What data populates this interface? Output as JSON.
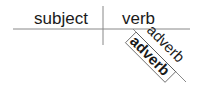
{
  "diagram": {
    "type": "sentence-diagram",
    "subject": "subject",
    "verb": "verb",
    "modifiers": [
      {
        "label": "adverb",
        "style": "regular"
      },
      {
        "label": "adverb",
        "style": "bold-outlined"
      }
    ],
    "colors": {
      "line": "#888888",
      "text": "#1a1a1a"
    }
  }
}
